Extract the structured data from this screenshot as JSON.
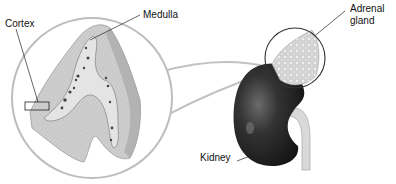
{
  "diagram": {
    "labels": {
      "cortex": "Cortex",
      "medulla": "Medulla",
      "adrenal_gland_line1": "Adrenal",
      "adrenal_gland_line2": "gland",
      "kidney": "Kidney"
    },
    "colors": {
      "background": "#ffffff",
      "circle_stroke": "#b5b5b5",
      "cortex_fill": "#c9c9c9",
      "medulla_fill": "#e6e6e6",
      "kidney_fill": "#2b2b2b",
      "leader_line": "#222222"
    }
  }
}
